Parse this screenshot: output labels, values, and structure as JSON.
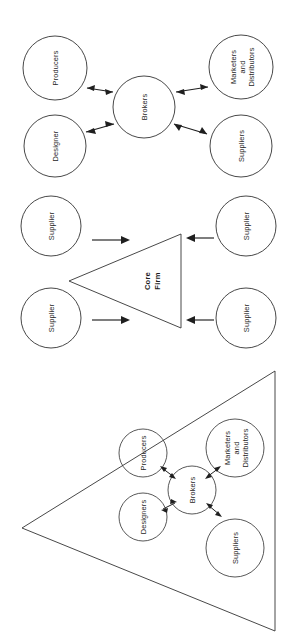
{
  "figure": {
    "orientation": "rotated-90-ccw",
    "background_color": "#ffffff",
    "stroke_color": "#333333",
    "text_color": "#262626",
    "panels": [
      {
        "id": "panel-broker-network",
        "position": "top",
        "type": "hub-and-spoke",
        "center": {
          "label": "Brokers"
        },
        "nodes": [
          {
            "id": "producers",
            "label": "Producers",
            "lines": [
              "Producers"
            ]
          },
          {
            "id": "marketers-distributors",
            "label": "Marketers and Distributors",
            "lines": [
              "Marketers",
              "and",
              "Distributors"
            ]
          },
          {
            "id": "designer",
            "label": "Designer",
            "lines": [
              "Designer"
            ]
          },
          {
            "id": "suppliers",
            "label": "Suppliers",
            "lines": [
              "Suppliers"
            ]
          }
        ],
        "connector_style": "double-headed-arrow",
        "connector_count": 4
      },
      {
        "id": "panel-core-firm",
        "position": "middle",
        "type": "triangle-with-inputs",
        "center": {
          "label": "Core Firm",
          "lines": [
            "Core",
            "Firm"
          ]
        },
        "nodes": [
          {
            "id": "supplier-1",
            "label": "Supplier",
            "lines": [
              "Supplier"
            ]
          },
          {
            "id": "supplier-2",
            "label": "Supplier",
            "lines": [
              "Supplier"
            ]
          },
          {
            "id": "supplier-3",
            "label": "Supplier",
            "lines": [
              "Supplier"
            ]
          },
          {
            "id": "supplier-4",
            "label": "Supplier",
            "lines": [
              "Supplier"
            ]
          }
        ],
        "connector_style": "single-headed-arrow",
        "connector_count": 4
      },
      {
        "id": "panel-embedded-network",
        "position": "bottom",
        "type": "triangle-containing-network",
        "center": {
          "label": "Brokers",
          "lines": [
            "Brokers"
          ]
        },
        "nodes": [
          {
            "id": "producers",
            "label": "Producers",
            "lines": [
              "Producers"
            ]
          },
          {
            "id": "designers",
            "label": "Designers",
            "lines": [
              "Designers"
            ]
          },
          {
            "id": "marketers-distributors",
            "label": "Marketers and Distributors",
            "lines": [
              "Marketers",
              "and",
              "Distributors"
            ]
          },
          {
            "id": "suppliers",
            "label": "Suppliers",
            "lines": [
              "Suppliers"
            ]
          }
        ],
        "connector_style": "double-headed-arrow",
        "connector_count": 4
      }
    ]
  }
}
